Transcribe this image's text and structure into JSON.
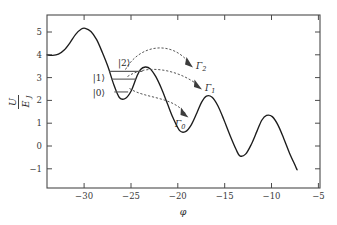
{
  "figure": {
    "axes": {
      "xlabel": "φ",
      "ylabel_num": "U",
      "ylabel_den": "E",
      "ylabel_den_sub": "J",
      "xticks": [
        "−30",
        "−25",
        "−20",
        "−15",
        "−10",
        "−5"
      ],
      "xtick_values": [
        -30,
        -25,
        -20,
        -15,
        -10,
        -5
      ],
      "yticks": [
        "5",
        "4",
        "3",
        "2",
        "1",
        "0",
        "−1"
      ],
      "ytick_values": [
        5,
        4,
        3,
        2,
        1,
        0,
        -1
      ],
      "xlim": [
        -32.6,
        -4.0
      ],
      "ylim": [
        -1.55,
        5.6
      ]
    },
    "state_labels": [
      {
        "name": "ket-2",
        "text": "|2⟩"
      },
      {
        "name": "ket-1",
        "text": "|1⟩"
      },
      {
        "name": "ket-0",
        "text": "|0⟩"
      }
    ],
    "gamma_labels": [
      {
        "name": "gamma-2",
        "base": "Γ",
        "sub": "2"
      },
      {
        "name": "gamma-1",
        "base": "Γ",
        "sub": "1"
      },
      {
        "name": "gamma-0",
        "base": "Γ",
        "sub": "0"
      }
    ],
    "colors": {
      "curve": "#1c1c1c",
      "axis": "#4a4a4a",
      "level": "#5d5d5d",
      "arrow": "#555555",
      "background": "#ffffff"
    }
  },
  "chart_data": {
    "type": "line",
    "title": "",
    "xlabel": "φ",
    "ylabel": "U/E_J",
    "xlim": [
      -32.6,
      -4.0
    ],
    "ylim": [
      -1.55,
      5.6
    ],
    "grid": false,
    "legend": null,
    "series": [
      {
        "name": "U/E_J washboard potential",
        "x": [
          -32.6,
          -32.0,
          -31.4,
          -30.8,
          -30.2,
          -29.6,
          -29.0,
          -28.6,
          -28.0,
          -27.4,
          -26.8,
          -26.2,
          -25.6,
          -25.0,
          -24.4,
          -23.8,
          -23.2,
          -22.8,
          -22.3,
          -21.8,
          -21.2,
          -20.6,
          -20.0,
          -19.4,
          -18.7,
          -18.1,
          -17.5,
          -16.9,
          -16.4,
          -15.9,
          -15.3,
          -14.7,
          -14.1,
          -13.4,
          -12.8,
          -12.4,
          -11.8,
          -11.2,
          -10.6,
          -10.1,
          -9.6,
          -9.0,
          -8.4,
          -7.8,
          -7.2,
          -6.6,
          -6.4
        ],
        "y": [
          3.95,
          3.93,
          3.98,
          4.15,
          4.45,
          4.8,
          5.02,
          5.05,
          4.92,
          4.58,
          4.05,
          3.45,
          2.72,
          2.18,
          2.15,
          2.45,
          3.05,
          3.35,
          3.45,
          3.38,
          3.05,
          2.55,
          1.95,
          1.35,
          0.82,
          0.78,
          1.05,
          1.55,
          2.0,
          2.25,
          2.2,
          1.85,
          1.3,
          0.6,
          0.05,
          -0.22,
          -0.15,
          0.25,
          0.8,
          1.25,
          1.45,
          1.4,
          1.05,
          0.5,
          -0.1,
          -0.62,
          -0.8
        ]
      }
    ],
    "energy_levels": [
      {
        "label": "|2⟩",
        "energy": 3.27,
        "phi_left": -26.05,
        "phi_right": -22.6
      },
      {
        "label": "|1⟩",
        "energy": 2.95,
        "phi_left": -25.85,
        "phi_right": -23.3
      },
      {
        "label": "|0⟩",
        "energy": 2.42,
        "phi_left": -25.55,
        "phi_right": -24.1
      }
    ],
    "annotations": [
      {
        "label": "Γ2",
        "from_state": "|2⟩",
        "to_phi": -18.2,
        "to_energy": 3.05,
        "style": "dashed-arrow",
        "meaning": "escape rate from level 2"
      },
      {
        "label": "Γ1",
        "from_state": "|1⟩",
        "to_phi": -17.3,
        "to_energy": 2.1,
        "style": "dashed-arrow",
        "meaning": "escape rate from level 1"
      },
      {
        "label": "Γ0",
        "from_state": "|0⟩",
        "to_phi": -18.6,
        "to_energy": 1.32,
        "style": "dashed-arrow",
        "meaning": "escape rate from level 0"
      }
    ]
  }
}
